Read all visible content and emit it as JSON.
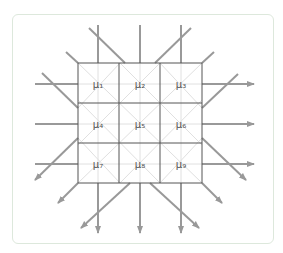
{
  "diagram": {
    "colors": {
      "frame_border": "#dde8dc",
      "grid_line": "#555555",
      "faint_line": "#dddddd",
      "arrow": "#999999",
      "label": "#555555"
    },
    "cells": [
      {
        "id": "mu1",
        "label": "μ₁"
      },
      {
        "id": "mu2",
        "label": "μ₂"
      },
      {
        "id": "mu3",
        "label": "μ₃"
      },
      {
        "id": "mu4",
        "label": "μ₄"
      },
      {
        "id": "mu5",
        "label": "μ₅"
      },
      {
        "id": "mu6",
        "label": "μ₆"
      },
      {
        "id": "mu7",
        "label": "μ₇"
      },
      {
        "id": "mu8",
        "label": "μ₈"
      },
      {
        "id": "mu9",
        "label": "μ₉"
      }
    ]
  }
}
